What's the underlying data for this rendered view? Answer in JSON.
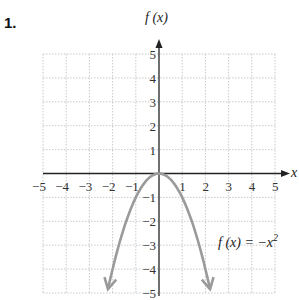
{
  "problem_number": "1.",
  "chart_data": {
    "type": "line",
    "title": "",
    "xlabel": "x",
    "ylabel": "f (x)",
    "xlim": [
      -5,
      5
    ],
    "ylim": [
      -5,
      5
    ],
    "grid": true,
    "x_ticks": [
      "-5",
      "-4",
      "-3",
      "-2",
      "-1",
      "1",
      "2",
      "3",
      "4",
      "5"
    ],
    "y_ticks": [
      "5",
      "4",
      "3",
      "2",
      "1",
      "-1",
      "-2",
      "-3",
      "-4",
      "-5"
    ],
    "series": [
      {
        "name": "f(x) = -x^2",
        "function": "-x^2",
        "x": [
          -2.24,
          -2,
          -1.5,
          -1,
          -0.5,
          0,
          0.5,
          1,
          1.5,
          2,
          2.24
        ],
        "y": [
          -5,
          -4,
          -2.25,
          -1,
          -0.25,
          0,
          -0.25,
          -1,
          -2.25,
          -4,
          -5
        ],
        "color": "#9a9a9a",
        "arrows_at_ends": true
      }
    ],
    "annotations": [
      {
        "text": "f (x) = −x²",
        "x": 3.3,
        "y": -3
      }
    ]
  },
  "labels": {
    "y_axis": "f (x)",
    "x_axis": "x",
    "equation_main": "f (x) = −x",
    "equation_exp": "2"
  }
}
